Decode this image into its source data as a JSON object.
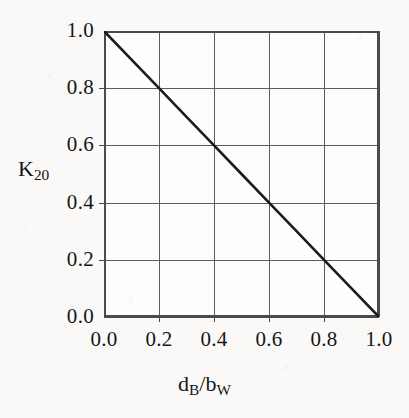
{
  "chart_data": {
    "type": "line",
    "title": "",
    "subtitle": "",
    "xlabel": "d_B/b_W",
    "ylabel": "K_20",
    "xlabel_parts": {
      "base1": "d",
      "sub1": "B",
      "separator": "/",
      "base2": "b",
      "sub2": "W"
    },
    "ylabel_parts": {
      "base": "K",
      "sub": "20"
    },
    "xlim": [
      0.0,
      1.0
    ],
    "ylim": [
      0.0,
      1.0
    ],
    "xticks": [
      0.0,
      0.2,
      0.4,
      0.6,
      0.8,
      1.0
    ],
    "yticks": [
      0.0,
      0.2,
      0.4,
      0.6,
      0.8,
      1.0
    ],
    "xtick_labels": [
      "0.0",
      "0.2",
      "0.4",
      "0.6",
      "0.8",
      "1.0"
    ],
    "ytick_labels": [
      "0.0",
      "0.2",
      "0.4",
      "0.6",
      "0.8",
      "1.0"
    ],
    "grid": true,
    "grid_color": "#5c5c5c",
    "frame_color": "#4a4a4a",
    "legend": null,
    "legend_position": "none",
    "series": [
      {
        "name": "K20 vs dB/bW",
        "color": "#1b1b1b",
        "line_width": 2.6,
        "style": "solid",
        "x": [
          0.0,
          0.1,
          0.2,
          0.3,
          0.4,
          0.5,
          0.6,
          0.7,
          0.8,
          0.9,
          1.0
        ],
        "values": [
          1.0,
          0.9,
          0.8,
          0.7,
          0.6,
          0.5,
          0.4,
          0.3,
          0.2,
          0.1,
          0.0
        ]
      }
    ],
    "annotations": []
  },
  "figure": {
    "background": "#faf9f7",
    "plot_background": "#fdfdfb",
    "width": 409,
    "height": 418
  }
}
